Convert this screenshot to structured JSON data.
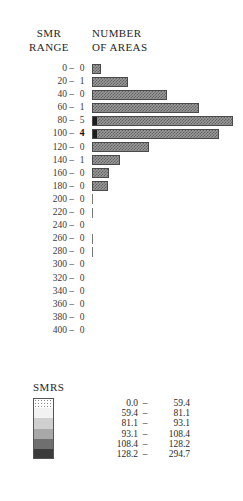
{
  "header": {
    "left_line1": "SMR",
    "left_line2": "RANGE",
    "right_line1": "NUMBER",
    "right_line2": "OF AREAS"
  },
  "legend": {
    "title": "SMRS",
    "entries": [
      {
        "lo": "0.0",
        "dash": "–",
        "hi": "59.4",
        "color": "#ffffff",
        "pattern": "dotted"
      },
      {
        "lo": "59.4",
        "dash": "–",
        "hi": "81.1",
        "color": "#f2f2f2",
        "pattern": "solid"
      },
      {
        "lo": "81.1",
        "dash": "–",
        "hi": "93.1",
        "color": "#cfcfcf",
        "pattern": "solid"
      },
      {
        "lo": "93.1",
        "dash": "–",
        "hi": "108.4",
        "color": "#a8a8a8",
        "pattern": "solid"
      },
      {
        "lo": "108.4",
        "dash": "–",
        "hi": "128.2",
        "color": "#6f6f6f",
        "pattern": "solid"
      },
      {
        "lo": "128.2",
        "dash": "–",
        "hi": "294.7",
        "color": "#3b3b3b",
        "pattern": "solid"
      }
    ]
  },
  "chart_data": {
    "type": "bar",
    "xlabel": "",
    "ylabel": "SMR RANGE",
    "orientation": "horizontal",
    "categories": [
      "0 –",
      "20 –",
      "40 –",
      "60 –",
      "80 –",
      "100 –",
      "120 –",
      "140 –",
      "160 –",
      "180 –",
      "200 –",
      "220 –",
      "240 –",
      "260 –",
      "280 –",
      "300 –",
      "320 –",
      "340 –",
      "360 –",
      "380 –",
      "400 –"
    ],
    "count_labels": [
      "0",
      "1",
      "0",
      "1",
      "5",
      "4",
      "0",
      "1",
      "0",
      "0",
      "0",
      "0",
      "0",
      "0",
      "0",
      "0",
      "0",
      "0",
      "0",
      "0",
      "0"
    ],
    "count_bold": [
      false,
      false,
      false,
      false,
      false,
      true,
      false,
      false,
      false,
      false,
      false,
      false,
      false,
      false,
      false,
      false,
      false,
      false,
      false,
      false,
      false
    ],
    "bar_lengths": [
      9,
      36,
      75,
      107,
      141,
      127,
      57,
      28,
      17,
      16,
      1,
      1,
      0,
      1,
      1,
      0,
      0,
      0,
      0,
      0,
      0
    ],
    "dark_segment": [
      0,
      0,
      0,
      0,
      4,
      4,
      0,
      0,
      0,
      0,
      0,
      0,
      0,
      0,
      0,
      0,
      0,
      0,
      0,
      0,
      0
    ],
    "is_tick": [
      false,
      false,
      false,
      false,
      false,
      false,
      false,
      false,
      false,
      false,
      true,
      true,
      false,
      true,
      true,
      false,
      false,
      false,
      false,
      false,
      false
    ],
    "xlim": [
      0,
      141
    ],
    "grid": false,
    "legend_position": "bottom-left"
  }
}
